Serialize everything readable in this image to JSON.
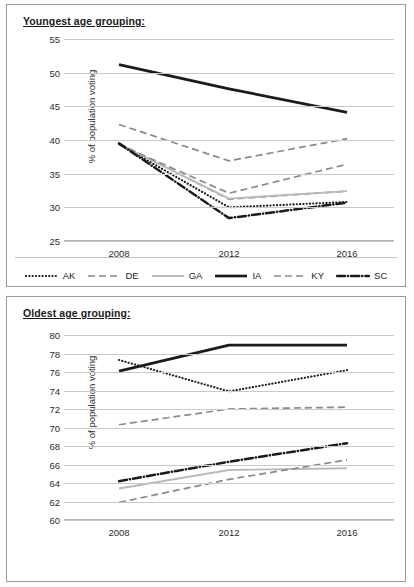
{
  "charts": [
    {
      "id": "youngest",
      "title": "Youngest age grouping:",
      "ylabel": "% of population voting",
      "xticks": [
        "2008",
        "2012",
        "2016"
      ],
      "yticks": [
        "55",
        "50",
        "45",
        "40",
        "35",
        "30",
        "25"
      ]
    },
    {
      "id": "oldest",
      "title": "Oldest age grouping:",
      "ylabel": "% of population voting",
      "xticks": [
        "2008",
        "2012",
        "2016"
      ],
      "yticks": [
        "80",
        "78",
        "76",
        "74",
        "72",
        "70",
        "68",
        "66",
        "64",
        "62",
        "60"
      ]
    }
  ],
  "legend": {
    "items": [
      {
        "label": "AK",
        "style": "dotted-black"
      },
      {
        "label": "DE",
        "style": "dashed-gray"
      },
      {
        "label": "GA",
        "style": "solid-lightgray"
      },
      {
        "label": "IA",
        "style": "solid-black-thick"
      },
      {
        "label": "KY",
        "style": "dashed-darkgray"
      },
      {
        "label": "SC",
        "style": "dashdot-black"
      }
    ]
  },
  "colors": {
    "black": "#1b1b1b",
    "gray": "#8a8a8a",
    "dark_gray": "#707070",
    "light_gray": "#b9b9b9",
    "gridline": "#c9c9c9",
    "border": "#9a9a9a",
    "background": "#ffffff"
  },
  "chart_data": [
    {
      "type": "line",
      "title": "Youngest age grouping:",
      "xlabel": "",
      "ylabel": "% of population voting",
      "categories": [
        2008,
        2012,
        2016
      ],
      "x": [
        "2008",
        "2012",
        "2016"
      ],
      "ylim": [
        25,
        55
      ],
      "ytick_step": 5,
      "grid": true,
      "legend_position": "bottom",
      "series": [
        {
          "name": "AK",
          "style": "dotted-black",
          "color": "#1b1b1b",
          "values": [
            39.4,
            30.0,
            30.8
          ]
        },
        {
          "name": "DE",
          "style": "dashed-gray",
          "color": "#8a8a8a",
          "values": [
            39.5,
            31.2,
            32.4
          ]
        },
        {
          "name": "GA",
          "style": "solid-lightgray",
          "color": "#b9b9b9",
          "values": [
            39.4,
            31.3,
            32.4
          ]
        },
        {
          "name": "IA",
          "style": "solid-black-thick",
          "color": "#1b1b1b",
          "values": [
            51.2,
            47.6,
            44.1
          ]
        },
        {
          "name": "KY",
          "style": "dashed-darkgray",
          "color": "#8a8a8a",
          "values": [
            39.3,
            32.1,
            36.4
          ]
        },
        {
          "name": "SC",
          "style": "dashdot-black",
          "color": "#1b1b1b",
          "values": [
            39.5,
            28.4,
            30.7
          ]
        },
        {
          "name": "DE-upper",
          "style": "dashed-gray",
          "color": "#8a8a8a",
          "values": [
            42.3,
            36.9,
            40.2
          ]
        }
      ],
      "notes": "Six state series plus upper dashed DE trace; all decline from 2008 to 2012 then partially recover by 2016, except IA which declines steadily."
    },
    {
      "type": "line",
      "title": "Oldest age grouping:",
      "xlabel": "",
      "ylabel": "% of population voting",
      "categories": [
        2008,
        2012,
        2016
      ],
      "x": [
        "2008",
        "2012",
        "2016"
      ],
      "ylim": [
        60,
        80
      ],
      "ytick_step": 2,
      "grid": true,
      "legend_position": "bottom",
      "series": [
        {
          "name": "AK",
          "style": "dotted-black",
          "color": "#1b1b1b",
          "values": [
            77.3,
            73.9,
            76.2
          ]
        },
        {
          "name": "DE",
          "style": "dashed-gray",
          "color": "#8a8a8a",
          "values": [
            70.3,
            72.0,
            72.2
          ]
        },
        {
          "name": "GA",
          "style": "solid-lightgray",
          "color": "#b9b9b9",
          "values": [
            63.4,
            65.4,
            65.6
          ]
        },
        {
          "name": "IA",
          "style": "solid-black-thick",
          "color": "#1b1b1b",
          "values": [
            76.1,
            78.9,
            78.9
          ]
        },
        {
          "name": "KY",
          "style": "dashed-darkgray",
          "color": "#8a8a8a",
          "values": [
            61.9,
            64.4,
            66.5
          ]
        },
        {
          "name": "SC",
          "style": "dashdot-black",
          "color": "#1b1b1b",
          "values": [
            64.2,
            66.3,
            68.3
          ]
        }
      ],
      "notes": "All six series rise from 2008 to 2016 except AK, which dips at 2012 before recovering."
    }
  ]
}
